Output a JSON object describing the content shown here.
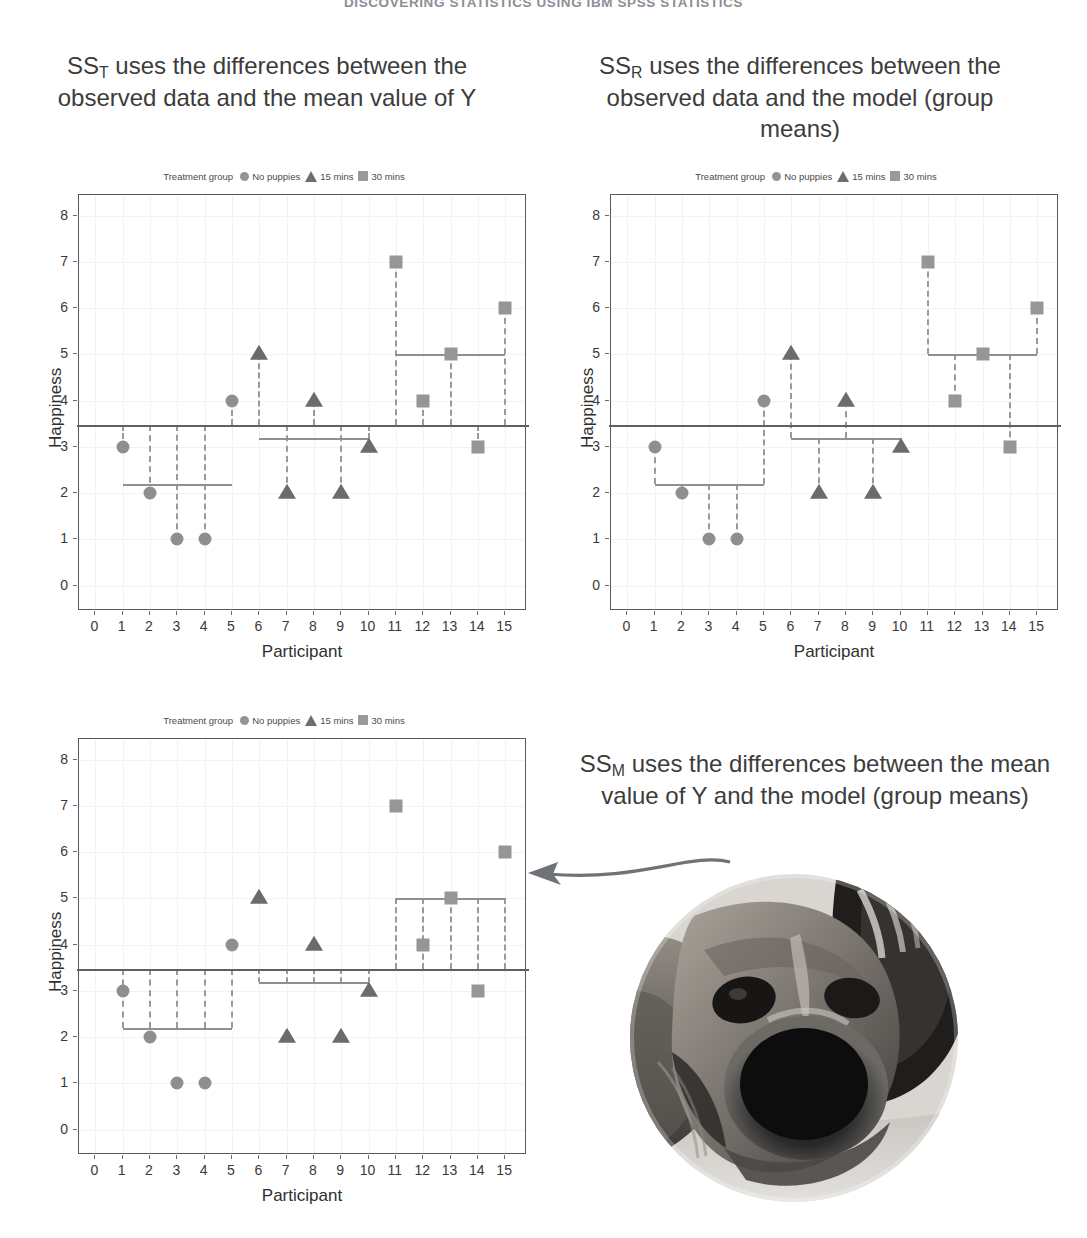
{
  "running_head": "DISCOVERING STATISTICS USING IBM SPSS STATISTICS",
  "captions": {
    "sst": {
      "prefix": "SS",
      "sub": "T",
      "rest": " uses the differences between the observed data and the mean value of Y"
    },
    "ssr": {
      "prefix": "SS",
      "sub": "R",
      "rest": " uses the differences between the observed data and the model (group means)"
    },
    "ssm": {
      "prefix": "SS",
      "sub": "M",
      "rest": " uses the differences between the mean value of Y and the model (group means)"
    }
  },
  "legend": {
    "title": "Treatment group",
    "entries": [
      {
        "icon": "circle-marker-icon",
        "label": "No puppies",
        "color": "#949494"
      },
      {
        "icon": "triangle-marker-icon",
        "label": "15 mins",
        "color": "#6e6e6e"
      },
      {
        "icon": "square-marker-icon",
        "label": "30 mins",
        "color": "#9a9a9a"
      }
    ]
  },
  "colors": {
    "circle": "#8f8f8f",
    "triangle": "#6b6b6b",
    "square": "#969696",
    "grand_mean_line": "#5d6166",
    "group_mean_line": "#8d9196",
    "dashed": "#9a9a9a",
    "frame": "#555a5f",
    "arrow": "#6f7276"
  },
  "chart_data": [
    {
      "id": "sst",
      "type": "scatter",
      "title": "SS_T uses the differences between the observed data and the mean value of Y",
      "xlabel": "Participant",
      "ylabel": "Happiness",
      "xlim": [
        -0.6,
        15.8
      ],
      "ylim": [
        -0.55,
        8.45
      ],
      "xticks": [
        0,
        1,
        2,
        3,
        4,
        5,
        6,
        7,
        8,
        9,
        10,
        11,
        12,
        13,
        14,
        15
      ],
      "yticks": [
        0,
        1,
        2,
        3,
        4,
        5,
        6,
        7,
        8
      ],
      "grid": true,
      "legend_position": "top",
      "grand_mean": 3.47,
      "group_means": [
        {
          "group": "No puppies",
          "value": 2.2,
          "x_from": 1,
          "x_to": 5
        },
        {
          "group": "15 mins",
          "value": 3.2,
          "x_from": 6,
          "x_to": 10
        },
        {
          "group": "30 mins",
          "value": 5.0,
          "x_from": 11,
          "x_to": 15
        }
      ],
      "points": [
        {
          "x": 1,
          "y": 3,
          "group": "No puppies",
          "marker": "circle"
        },
        {
          "x": 2,
          "y": 2,
          "group": "No puppies",
          "marker": "circle"
        },
        {
          "x": 3,
          "y": 1,
          "group": "No puppies",
          "marker": "circle"
        },
        {
          "x": 4,
          "y": 1,
          "group": "No puppies",
          "marker": "circle"
        },
        {
          "x": 5,
          "y": 4,
          "group": "No puppies",
          "marker": "circle"
        },
        {
          "x": 6,
          "y": 5,
          "group": "15 mins",
          "marker": "triangle"
        },
        {
          "x": 7,
          "y": 2,
          "group": "15 mins",
          "marker": "triangle"
        },
        {
          "x": 8,
          "y": 4,
          "group": "15 mins",
          "marker": "triangle"
        },
        {
          "x": 9,
          "y": 2,
          "group": "15 mins",
          "marker": "triangle"
        },
        {
          "x": 10,
          "y": 3,
          "group": "15 mins",
          "marker": "triangle"
        },
        {
          "x": 11,
          "y": 7,
          "group": "30 mins",
          "marker": "square"
        },
        {
          "x": 12,
          "y": 4,
          "group": "30 mins",
          "marker": "square"
        },
        {
          "x": 13,
          "y": 5,
          "group": "30 mins",
          "marker": "square"
        },
        {
          "x": 14,
          "y": 3,
          "group": "30 mins",
          "marker": "square"
        },
        {
          "x": 15,
          "y": 6,
          "group": "30 mins",
          "marker": "square"
        }
      ],
      "deviation_lines": "each point to the grand mean line"
    },
    {
      "id": "ssr",
      "type": "scatter",
      "title": "SS_R uses the differences between the observed data and the model (group means)",
      "xlabel": "Participant",
      "ylabel": "Happiness",
      "xlim": [
        -0.6,
        15.8
      ],
      "ylim": [
        -0.55,
        8.45
      ],
      "xticks": [
        0,
        1,
        2,
        3,
        4,
        5,
        6,
        7,
        8,
        9,
        10,
        11,
        12,
        13,
        14,
        15
      ],
      "yticks": [
        0,
        1,
        2,
        3,
        4,
        5,
        6,
        7,
        8
      ],
      "grid": true,
      "legend_position": "top",
      "grand_mean": 3.47,
      "group_means": [
        {
          "group": "No puppies",
          "value": 2.2,
          "x_from": 1,
          "x_to": 5
        },
        {
          "group": "15 mins",
          "value": 3.2,
          "x_from": 6,
          "x_to": 10
        },
        {
          "group": "30 mins",
          "value": 5.0,
          "x_from": 11,
          "x_to": 15
        }
      ],
      "points": [
        {
          "x": 1,
          "y": 3,
          "group": "No puppies",
          "marker": "circle"
        },
        {
          "x": 2,
          "y": 2,
          "group": "No puppies",
          "marker": "circle"
        },
        {
          "x": 3,
          "y": 1,
          "group": "No puppies",
          "marker": "circle"
        },
        {
          "x": 4,
          "y": 1,
          "group": "No puppies",
          "marker": "circle"
        },
        {
          "x": 5,
          "y": 4,
          "group": "No puppies",
          "marker": "circle"
        },
        {
          "x": 6,
          "y": 5,
          "group": "15 mins",
          "marker": "triangle"
        },
        {
          "x": 7,
          "y": 2,
          "group": "15 mins",
          "marker": "triangle"
        },
        {
          "x": 8,
          "y": 4,
          "group": "15 mins",
          "marker": "triangle"
        },
        {
          "x": 9,
          "y": 2,
          "group": "15 mins",
          "marker": "triangle"
        },
        {
          "x": 10,
          "y": 3,
          "group": "15 mins",
          "marker": "triangle"
        },
        {
          "x": 11,
          "y": 7,
          "group": "30 mins",
          "marker": "square"
        },
        {
          "x": 12,
          "y": 4,
          "group": "30 mins",
          "marker": "square"
        },
        {
          "x": 13,
          "y": 5,
          "group": "30 mins",
          "marker": "square"
        },
        {
          "x": 14,
          "y": 3,
          "group": "30 mins",
          "marker": "square"
        },
        {
          "x": 15,
          "y": 6,
          "group": "30 mins",
          "marker": "square"
        }
      ],
      "deviation_lines": "each point to its own group mean line"
    },
    {
      "id": "ssm",
      "type": "scatter",
      "title": "SS_M uses the differences between the mean value of Y and the model (group means)",
      "xlabel": "Participant",
      "ylabel": "Happiness",
      "xlim": [
        -0.6,
        15.8
      ],
      "ylim": [
        -0.55,
        8.45
      ],
      "xticks": [
        0,
        1,
        2,
        3,
        4,
        5,
        6,
        7,
        8,
        9,
        10,
        11,
        12,
        13,
        14,
        15
      ],
      "yticks": [
        0,
        1,
        2,
        3,
        4,
        5,
        6,
        7,
        8
      ],
      "grid": true,
      "legend_position": "top",
      "grand_mean": 3.47,
      "group_means": [
        {
          "group": "No puppies",
          "value": 2.2,
          "x_from": 1,
          "x_to": 5
        },
        {
          "group": "15 mins",
          "value": 3.2,
          "x_from": 6,
          "x_to": 10
        },
        {
          "group": "30 mins",
          "value": 5.0,
          "x_from": 11,
          "x_to": 15
        }
      ],
      "points": [
        {
          "x": 1,
          "y": 3,
          "group": "No puppies",
          "marker": "circle"
        },
        {
          "x": 2,
          "y": 2,
          "group": "No puppies",
          "marker": "circle"
        },
        {
          "x": 3,
          "y": 1,
          "group": "No puppies",
          "marker": "circle"
        },
        {
          "x": 4,
          "y": 1,
          "group": "No puppies",
          "marker": "circle"
        },
        {
          "x": 5,
          "y": 4,
          "group": "No puppies",
          "marker": "circle"
        },
        {
          "x": 6,
          "y": 5,
          "group": "15 mins",
          "marker": "triangle"
        },
        {
          "x": 7,
          "y": 2,
          "group": "15 mins",
          "marker": "triangle"
        },
        {
          "x": 8,
          "y": 4,
          "group": "15 mins",
          "marker": "triangle"
        },
        {
          "x": 9,
          "y": 2,
          "group": "15 mins",
          "marker": "triangle"
        },
        {
          "x": 10,
          "y": 3,
          "group": "15 mins",
          "marker": "triangle"
        },
        {
          "x": 11,
          "y": 7,
          "group": "30 mins",
          "marker": "square"
        },
        {
          "x": 12,
          "y": 4,
          "group": "30 mins",
          "marker": "square"
        },
        {
          "x": 13,
          "y": 5,
          "group": "30 mins",
          "marker": "square"
        },
        {
          "x": 14,
          "y": 3,
          "group": "30 mins",
          "marker": "square"
        },
        {
          "x": 15,
          "y": 6,
          "group": "30 mins",
          "marker": "square"
        }
      ],
      "deviation_lines": "grand mean line to each group mean line at every participant position"
    }
  ],
  "photo": {
    "name": "puppy-photo",
    "description": "circular greyscale close-up photograph of a dog's face"
  }
}
